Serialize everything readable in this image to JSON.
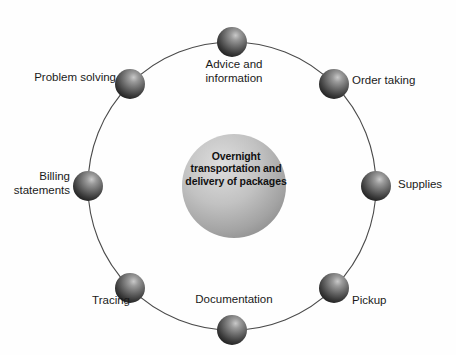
{
  "diagram": {
    "type": "circular-flower-of-service",
    "core": {
      "text": "Overnight\ntransportation\nand delivery of\npackages",
      "lines": [
        "Overnight",
        "transportation",
        "and delivery of",
        "packages"
      ],
      "fill_light": "#d8d8d8",
      "fill_dark": "#8c8c8c",
      "center_x": 234,
      "center_y": 186,
      "radius": 52
    },
    "ring": {
      "center_x": 232,
      "center_y": 186,
      "radius": 144,
      "stroke": "#4a4a4a",
      "stroke_width": 1
    },
    "node_style": {
      "radius": 15,
      "highlight": "#b5b5b5",
      "mid": "#6e6e6e",
      "shadow": "#232323"
    },
    "nodes": [
      {
        "id": "advice-and-information",
        "label": "Advice and\ninformation",
        "angle_deg": -90,
        "cx": 232,
        "cy": 42
      },
      {
        "id": "order-taking",
        "label": "Order taking",
        "angle_deg": -45,
        "cx": 334,
        "cy": 84
      },
      {
        "id": "supplies",
        "label": "Supplies",
        "angle_deg": 0,
        "cx": 376,
        "cy": 186
      },
      {
        "id": "pickup",
        "label": "Pickup",
        "angle_deg": 45,
        "cx": 334,
        "cy": 288
      },
      {
        "id": "documentation",
        "label": "Documentation",
        "angle_deg": 90,
        "cx": 232,
        "cy": 330
      },
      {
        "id": "tracing",
        "label": "Tracing",
        "angle_deg": 135,
        "cx": 130,
        "cy": 288
      },
      {
        "id": "billing-statements",
        "label": "Billing\nstatements",
        "angle_deg": 180,
        "cx": 88,
        "cy": 186
      },
      {
        "id": "problem-solving",
        "label": "Problem solving",
        "angle_deg": 225,
        "cx": 130,
        "cy": 84
      }
    ]
  }
}
